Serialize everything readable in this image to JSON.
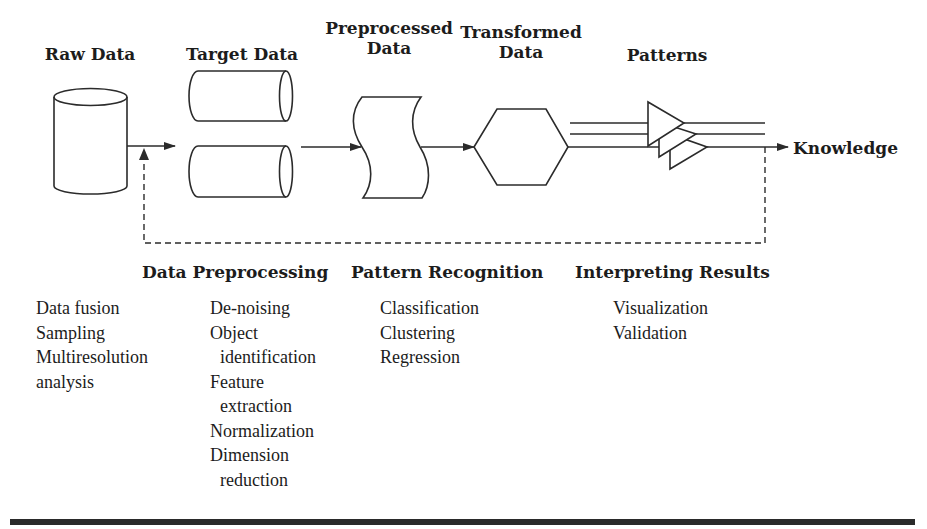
{
  "stages": {
    "raw_data": "Raw Data",
    "target_data": "Target Data",
    "preprocessed_data": [
      "Preprocessed",
      "Data"
    ],
    "transformed_data": [
      "Transformed",
      "Data"
    ],
    "patterns": "Patterns",
    "knowledge": "Knowledge"
  },
  "processes": {
    "data_preprocessing": "Data Preprocessing",
    "pattern_recognition": "Pattern Recognition",
    "interpreting_results": "Interpreting Results"
  },
  "lists": {
    "raw_data_ops": [
      "Data fusion",
      "Sampling",
      "Multiresolution",
      "analysis"
    ],
    "data_preprocessing_ops": [
      "De-noising",
      "Object",
      "identification",
      "Feature",
      "extraction",
      "Normalization",
      "Dimension",
      "reduction"
    ],
    "pattern_recognition_ops": [
      "Classification",
      "Clustering",
      "Regression"
    ],
    "interpreting_results_ops": [
      "Visualization",
      "Validation"
    ]
  },
  "shapes": {
    "raw_data": "vertical-cylinder",
    "target_data": "two-horizontal-cylinders",
    "preprocessed_data": "wavy-document",
    "transformed_data": "hexagon",
    "patterns": "stacked-triangles"
  },
  "colors": {
    "stroke": "#2b2b2b",
    "text": "#1c1c1c",
    "background": "#ffffff"
  }
}
